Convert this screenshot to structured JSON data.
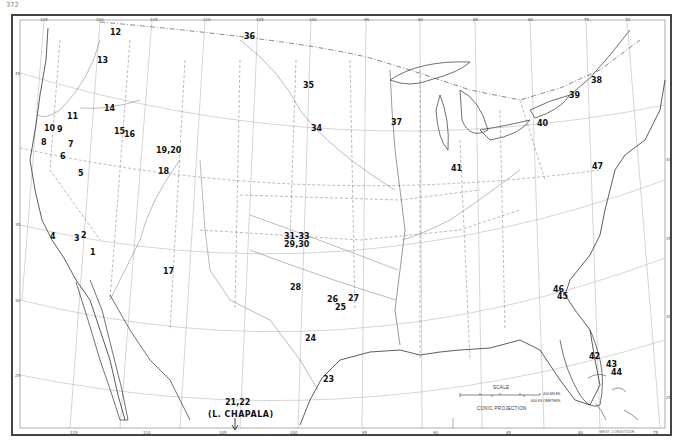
{
  "page": {
    "number": "372"
  },
  "map": {
    "title": "Conic projection map of the United States with numbered localities",
    "projection_label": "CONIC PROJECTION",
    "scale": {
      "title": "SCALE",
      "miles_label": "400 MILES",
      "km_label": "600 KILOMETERS",
      "mile_ticks": [
        "0",
        "100",
        "200",
        "300",
        "400"
      ],
      "km_ticks": [
        "0",
        "200",
        "400",
        "600"
      ]
    },
    "longitude_note": "WEST LONGITUDE",
    "top_longitudes": [
      "125",
      "120",
      "115",
      "110",
      "105",
      "100",
      "95",
      "90",
      "85",
      "80",
      "75",
      "70"
    ],
    "bottom_longitudes": [
      "115",
      "110",
      "105",
      "100",
      "95",
      "90",
      "85",
      "80",
      "75"
    ],
    "left_latitudes": [
      "45",
      "35",
      "30",
      "25"
    ],
    "right_latitudes": [
      "40",
      "35",
      "30",
      "25"
    ],
    "inset_note": {
      "numbers": "21,22",
      "label": "(L. CHAPALA)"
    },
    "sites": [
      {
        "label": "1",
        "x": 90,
        "y": 249
      },
      {
        "label": "2",
        "x": 81,
        "y": 232
      },
      {
        "label": "3",
        "x": 74,
        "y": 235
      },
      {
        "label": "4",
        "x": 50,
        "y": 233
      },
      {
        "label": "5",
        "x": 78,
        "y": 170
      },
      {
        "label": "6",
        "x": 60,
        "y": 153
      },
      {
        "label": "7",
        "x": 68,
        "y": 141
      },
      {
        "label": "8",
        "x": 41,
        "y": 139
      },
      {
        "label": "9",
        "x": 57,
        "y": 126
      },
      {
        "label": "10",
        "x": 44,
        "y": 125
      },
      {
        "label": "11",
        "x": 67,
        "y": 113
      },
      {
        "label": "12",
        "x": 110,
        "y": 29
      },
      {
        "label": "13",
        "x": 97,
        "y": 57
      },
      {
        "label": "14",
        "x": 104,
        "y": 105
      },
      {
        "label": "15",
        "x": 114,
        "y": 128
      },
      {
        "label": "16",
        "x": 124,
        "y": 131
      },
      {
        "label": "17",
        "x": 163,
        "y": 268
      },
      {
        "label": "18",
        "x": 158,
        "y": 168
      },
      {
        "label": "19,20",
        "x": 156,
        "y": 147
      },
      {
        "label": "23",
        "x": 323,
        "y": 376
      },
      {
        "label": "24",
        "x": 305,
        "y": 335
      },
      {
        "label": "25",
        "x": 335,
        "y": 304
      },
      {
        "label": "26",
        "x": 327,
        "y": 296
      },
      {
        "label": "27",
        "x": 348,
        "y": 295
      },
      {
        "label": "28",
        "x": 290,
        "y": 284
      },
      {
        "label": "29,30",
        "x": 284,
        "y": 241
      },
      {
        "label": "31-33",
        "x": 284,
        "y": 233
      },
      {
        "label": "34",
        "x": 311,
        "y": 125
      },
      {
        "label": "35",
        "x": 303,
        "y": 82
      },
      {
        "label": "36",
        "x": 244,
        "y": 33
      },
      {
        "label": "37",
        "x": 391,
        "y": 119
      },
      {
        "label": "38",
        "x": 591,
        "y": 77
      },
      {
        "label": "39",
        "x": 569,
        "y": 92
      },
      {
        "label": "40",
        "x": 537,
        "y": 120
      },
      {
        "label": "41",
        "x": 451,
        "y": 165
      },
      {
        "label": "42",
        "x": 589,
        "y": 353
      },
      {
        "label": "43",
        "x": 606,
        "y": 361
      },
      {
        "label": "44",
        "x": 611,
        "y": 369
      },
      {
        "label": "45",
        "x": 557,
        "y": 293
      },
      {
        "label": "46",
        "x": 553,
        "y": 286
      },
      {
        "label": "47",
        "x": 592,
        "y": 163
      }
    ]
  }
}
